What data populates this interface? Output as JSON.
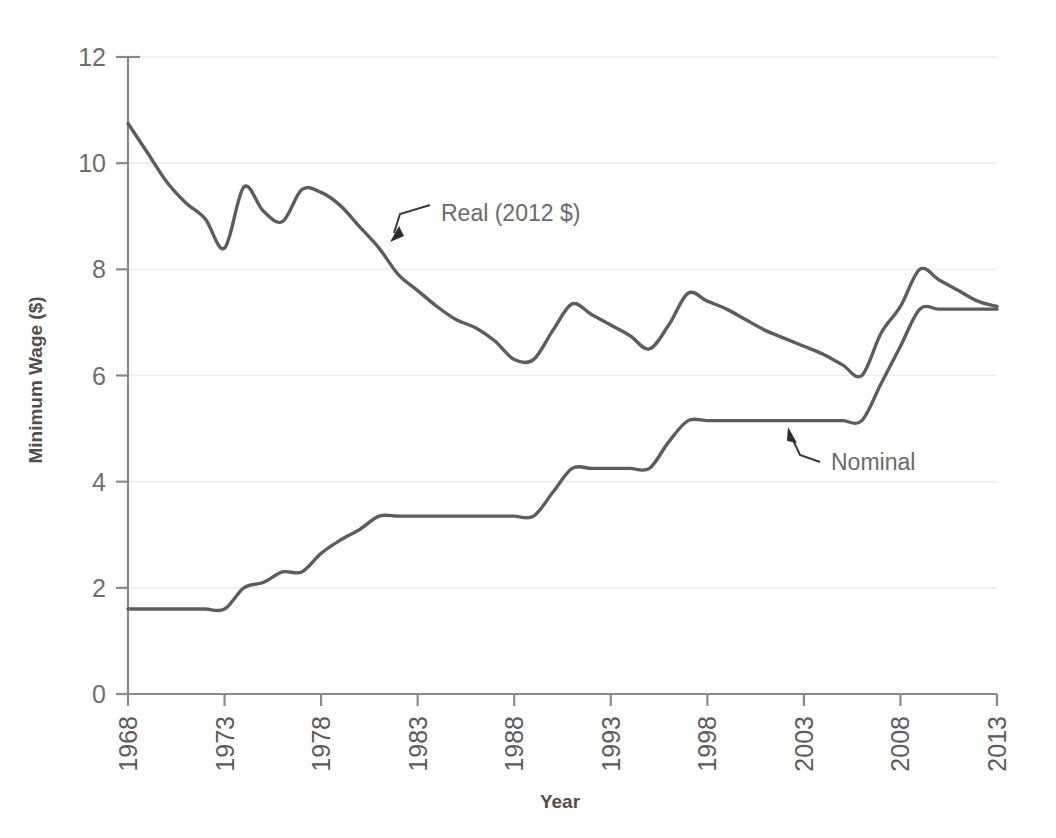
{
  "chart_data": {
    "type": "line",
    "title": "",
    "xlabel": "Year",
    "ylabel": "Minimum Wage ($)",
    "xlim": [
      1968,
      2013
    ],
    "ylim": [
      0,
      12
    ],
    "xticks": [
      1968,
      1973,
      1978,
      1983,
      1988,
      1993,
      1998,
      2003,
      2008,
      2013
    ],
    "yticks": [
      0,
      2,
      4,
      6,
      8,
      10,
      12
    ],
    "grid": "horizontal",
    "legend_position": "inline-annotations",
    "annotations": [
      {
        "text": "Real (2012 $)",
        "series": "Real (2012 $)",
        "x": 1983,
        "y": 8.75
      },
      {
        "text": "Nominal",
        "series": "Nominal",
        "x": 2004,
        "y": 4.55
      }
    ],
    "x": [
      1968,
      1969,
      1970,
      1971,
      1972,
      1973,
      1974,
      1975,
      1976,
      1977,
      1978,
      1979,
      1980,
      1981,
      1982,
      1983,
      1984,
      1985,
      1986,
      1987,
      1988,
      1989,
      1990,
      1991,
      1992,
      1993,
      1994,
      1995,
      1996,
      1997,
      1998,
      1999,
      2000,
      2001,
      2002,
      2003,
      2004,
      2005,
      2006,
      2007,
      2008,
      2009,
      2010,
      2011,
      2012,
      2013
    ],
    "series": [
      {
        "name": "Real (2012 $)",
        "color": "#5d5d5d",
        "values": [
          10.75,
          10.2,
          9.65,
          9.25,
          8.95,
          8.4,
          9.55,
          9.1,
          8.9,
          9.5,
          9.45,
          9.2,
          8.8,
          8.4,
          7.9,
          7.6,
          7.3,
          7.05,
          6.9,
          6.65,
          6.3,
          6.3,
          6.85,
          7.35,
          7.15,
          6.95,
          6.75,
          6.5,
          6.95,
          7.55,
          7.4,
          7.25,
          7.05,
          6.85,
          6.7,
          6.55,
          6.4,
          6.2,
          6.0,
          6.8,
          7.3,
          8.0,
          7.8,
          7.6,
          7.4,
          7.3
        ]
      },
      {
        "name": "Nominal",
        "color": "#5d5d5d",
        "values": [
          1.6,
          1.6,
          1.6,
          1.6,
          1.6,
          1.6,
          2.0,
          2.1,
          2.3,
          2.3,
          2.65,
          2.9,
          3.1,
          3.35,
          3.35,
          3.35,
          3.35,
          3.35,
          3.35,
          3.35,
          3.35,
          3.35,
          3.8,
          4.25,
          4.25,
          4.25,
          4.25,
          4.25,
          4.75,
          5.15,
          5.15,
          5.15,
          5.15,
          5.15,
          5.15,
          5.15,
          5.15,
          5.15,
          5.15,
          5.85,
          6.55,
          7.25,
          7.25,
          7.25,
          7.25,
          7.25
        ]
      }
    ]
  },
  "axes": {
    "y_title": "Minimum Wage ($)",
    "x_title": "Year",
    "y_tick_labels": [
      "0",
      "2",
      "4",
      "6",
      "8",
      "10",
      "12"
    ],
    "x_tick_labels": [
      "1968",
      "1973",
      "1978",
      "1983",
      "1988",
      "1993",
      "1998",
      "2003",
      "2008",
      "2013"
    ]
  },
  "labels": {
    "real": "Real (2012 $)",
    "nominal": "Nominal"
  },
  "colors": {
    "line": "#5d5d5d",
    "axis": "#8a8a8a",
    "grid": "#ededed",
    "text": "#6a6a6a",
    "background": "#ffffff"
  }
}
